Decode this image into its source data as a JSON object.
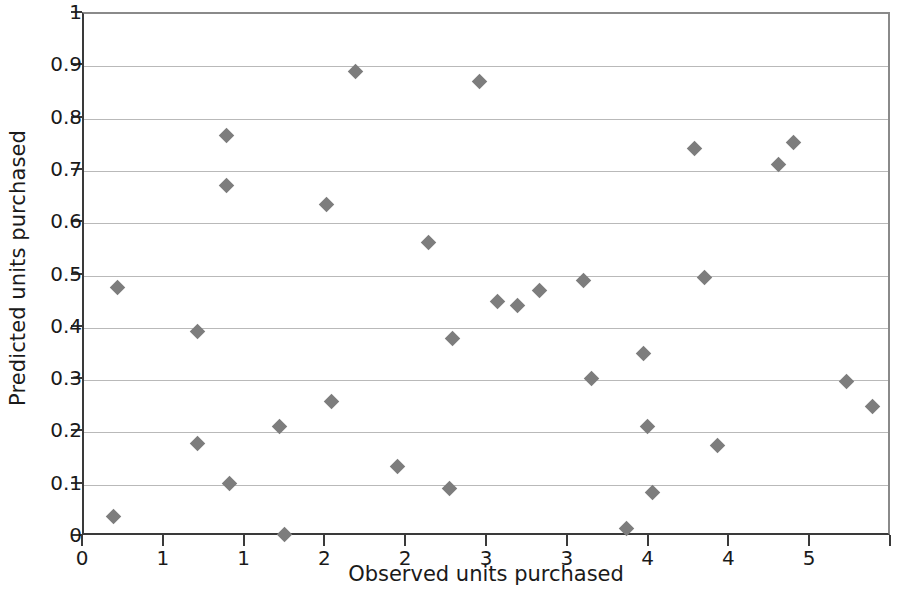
{
  "chart_data": {
    "type": "scatter",
    "title": "",
    "subtitle": "",
    "xlabel": "Observed units purchased",
    "ylabel": "Predicted units purchased",
    "xlim": [
      0,
      5
    ],
    "ylim": [
      0,
      1
    ],
    "x_ticks": [
      0,
      0.5,
      1,
      1.5,
      2,
      2.5,
      3,
      3.5,
      4,
      4.5,
      5
    ],
    "x_tick_labels": [
      "0",
      "1",
      "1",
      "2",
      "2",
      "3",
      "3",
      "4",
      "4",
      "5"
    ],
    "x_tick_label_values": [
      0,
      0.5,
      1,
      1.5,
      2,
      2.5,
      3,
      3.5,
      4,
      4.5,
      5
    ],
    "y_ticks": [
      0,
      0.1,
      0.2,
      0.3,
      0.4,
      0.5,
      0.6,
      0.7,
      0.8,
      0.9,
      1
    ],
    "y_tick_labels": [
      "0",
      "0.1",
      "0.2",
      "0.3",
      "0.4",
      "0.5",
      "0.6",
      "0.7",
      "0.8",
      "0.9",
      "1"
    ],
    "grid": "horizontal",
    "legend": "none",
    "marker": "diamond",
    "marker_color": "#7d7d7d",
    "axis_color": "#3a3a3a",
    "gridline_color": "#b9b9b9",
    "background_color": "#ffffff",
    "series": [
      {
        "name": "observations",
        "points": [
          [
            0.21,
            0.477
          ],
          [
            0.18,
            0.04
          ],
          [
            0.7,
            0.392
          ],
          [
            0.7,
            0.178
          ],
          [
            0.88,
            0.768
          ],
          [
            0.88,
            0.672
          ],
          [
            0.9,
            0.103
          ],
          [
            1.21,
            0.212
          ],
          [
            1.24,
            0.005
          ],
          [
            1.5,
            0.636
          ],
          [
            1.53,
            0.259
          ],
          [
            1.68,
            0.891
          ],
          [
            1.94,
            0.135
          ],
          [
            2.13,
            0.564
          ],
          [
            2.26,
            0.093
          ],
          [
            2.45,
            0.871
          ],
          [
            2.28,
            0.38
          ],
          [
            2.56,
            0.451
          ],
          [
            2.68,
            0.443
          ],
          [
            2.82,
            0.472
          ],
          [
            3.09,
            0.491
          ],
          [
            3.14,
            0.303
          ],
          [
            3.36,
            0.017
          ],
          [
            3.46,
            0.351
          ],
          [
            3.49,
            0.211
          ],
          [
            3.52,
            0.085
          ],
          [
            3.78,
            0.743
          ],
          [
            3.84,
            0.496
          ],
          [
            3.92,
            0.174
          ],
          [
            4.3,
            0.712
          ],
          [
            4.39,
            0.755
          ],
          [
            4.72,
            0.298
          ],
          [
            4.88,
            0.25
          ]
        ]
      }
    ]
  },
  "axes": {
    "y_title": "Predicted units purchased",
    "x_title": "Observed units purchased"
  }
}
